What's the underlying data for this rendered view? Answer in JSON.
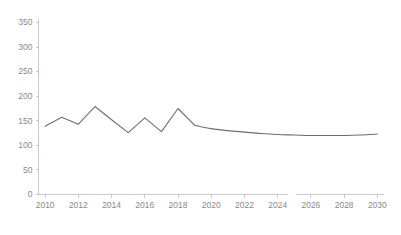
{
  "chart_data": {
    "type": "line",
    "title": "",
    "subtitle": "",
    "xlabel": "",
    "ylabel": "",
    "xlim": [
      2009.6,
      2030.4
    ],
    "ylim": [
      0,
      350
    ],
    "grid": false,
    "legend": null,
    "legend_position": "none",
    "y_ticks": [
      0,
      50,
      100,
      150,
      200,
      250,
      300,
      350
    ],
    "y_tick_labels": [
      "0",
      "50",
      "100",
      "150",
      "200",
      "250",
      "300",
      "350"
    ],
    "x_ticks": [
      2010,
      2012,
      2014,
      2016,
      2018,
      2020,
      2022,
      2024,
      2026,
      2028,
      2030
    ],
    "x_tick_labels": [
      "2010",
      "2012",
      "2014",
      "2016",
      "2018",
      "2020",
      "2022",
      "2024",
      "2026",
      "2028",
      "2030"
    ],
    "axis_break_after": 2024,
    "series": [
      {
        "name": "value",
        "color": "#6e6e6e",
        "x": [
          2010,
          2011,
          2012,
          2013,
          2014,
          2015,
          2016,
          2017,
          2018,
          2019,
          2020,
          2021,
          2022,
          2023,
          2024,
          2025,
          2026,
          2027,
          2028,
          2029,
          2030
        ],
        "values": [
          139,
          157,
          143,
          179,
          152,
          126,
          156,
          128,
          175,
          141,
          134,
          130,
          127,
          124,
          122,
          121,
          120,
          120,
          120,
          121,
          123
        ]
      }
    ],
    "annotations": [],
    "colors": {
      "line": "#6e6e6e",
      "axis": "#c9c9c9",
      "tick_label": "#8a8a8a",
      "background": "#ffffff"
    }
  }
}
